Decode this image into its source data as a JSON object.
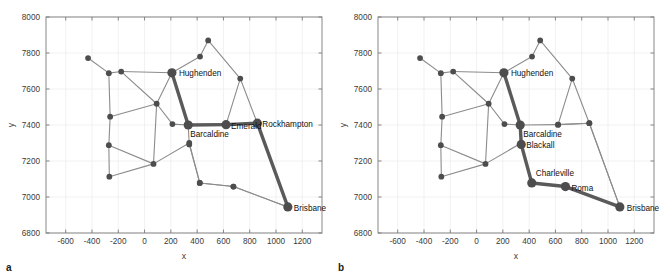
{
  "figure": {
    "type": "two-panel-network-map",
    "panels": [
      {
        "letter": "a",
        "highlighted_path": [
          "Hughenden",
          "Barcaldine",
          "Emerald",
          "Rockhampton",
          "Brisbane"
        ],
        "labeled_nodes": [
          "Hughenden",
          "Barcaldine",
          "Emerald",
          "Rockhampton",
          "Brisbane"
        ]
      },
      {
        "letter": "b",
        "highlighted_path": [
          "Hughenden",
          "Barcaldine",
          "Blackall",
          "Charleville",
          "Roma",
          "Brisbane"
        ],
        "labeled_nodes": [
          "Hughenden",
          "Barcaldine",
          "Blackall",
          "Charleville",
          "Roma",
          "Brisbane"
        ]
      }
    ]
  },
  "chart_data": {
    "type": "scatter",
    "title": "",
    "xlabel": "x",
    "ylabel": "y",
    "xlim": [
      -750,
      1350
    ],
    "ylim": [
      6800,
      8000
    ],
    "xticks": [
      -600,
      -400,
      -200,
      0,
      200,
      400,
      600,
      800,
      1000,
      1200
    ],
    "xticklabels": [
      "-600",
      "-400",
      "-200",
      "0",
      "200",
      "400",
      "600",
      "800",
      "1000",
      "1200"
    ],
    "yticks": [
      6800,
      7000,
      7200,
      7400,
      7600,
      7800,
      8000
    ],
    "yticklabels": [
      "6800",
      "7000",
      "7200",
      "7400",
      "7600",
      "7800",
      "8000"
    ],
    "grid": true,
    "legend": "none",
    "colors": {
      "node": "#4d4d4d",
      "edge": "#8c8c8c",
      "highlight_edge": "#5a5a5a",
      "grid": "#ededed",
      "axis": "#7a7a7a",
      "background": "#ffffff",
      "label_text": "#111111"
    },
    "nodes": [
      {
        "id": "n0",
        "x": -430,
        "y": 7772,
        "size": "small",
        "label": ""
      },
      {
        "id": "n1",
        "x": -272,
        "y": 7688,
        "size": "small",
        "label": ""
      },
      {
        "id": "n2",
        "x": -178,
        "y": 7697,
        "size": "small",
        "label": ""
      },
      {
        "id": "n3",
        "x": -262,
        "y": 7446,
        "size": "small",
        "label": ""
      },
      {
        "id": "n4",
        "x": -272,
        "y": 7288,
        "size": "small",
        "label": ""
      },
      {
        "id": "n5",
        "x": -268,
        "y": 7113,
        "size": "small",
        "label": ""
      },
      {
        "id": "n6",
        "x": 92,
        "y": 7518,
        "size": "small",
        "label": ""
      },
      {
        "id": "n7",
        "x": 68,
        "y": 7184,
        "size": "small",
        "label": ""
      },
      {
        "id": "n8",
        "x": 212,
        "y": 7405,
        "size": "small",
        "label": ""
      },
      {
        "id": "n9",
        "x": 340,
        "y": 7300,
        "size": "small",
        "label": ""
      },
      {
        "id": "n10",
        "x": 422,
        "y": 7780,
        "size": "small",
        "label": ""
      },
      {
        "id": "n11",
        "x": 484,
        "y": 7870,
        "size": "small",
        "label": ""
      },
      {
        "id": "n12",
        "x": 728,
        "y": 7658,
        "size": "small",
        "label": ""
      },
      {
        "id": "n13",
        "x": 620,
        "y": 7402,
        "size": "small",
        "label": ""
      },
      {
        "id": "n14",
        "x": 858,
        "y": 7410,
        "size": "small",
        "label": ""
      },
      {
        "id": "n15",
        "x": 420,
        "y": 7078,
        "size": "small",
        "label": ""
      },
      {
        "id": "n16",
        "x": 676,
        "y": 7058,
        "size": "small",
        "label": ""
      },
      {
        "id": "Hughenden",
        "x": 208,
        "y": 7690,
        "size": "large",
        "label": "Hughenden"
      },
      {
        "id": "Barcaldine",
        "x": 332,
        "y": 7400,
        "size": "large",
        "label": "Barcaldine"
      },
      {
        "id": "Blackall",
        "x": 340,
        "y": 7292,
        "size": "large",
        "label": "Blackall"
      },
      {
        "id": "Emerald",
        "x": 620,
        "y": 7402,
        "size": "large",
        "label": "Emerald"
      },
      {
        "id": "Rockhampton",
        "x": 858,
        "y": 7410,
        "size": "large",
        "label": "Rockhampton"
      },
      {
        "id": "Charleville",
        "x": 420,
        "y": 7078,
        "size": "large",
        "label": "Charleville"
      },
      {
        "id": "Roma",
        "x": 676,
        "y": 7058,
        "size": "large",
        "label": "Roma"
      },
      {
        "id": "Brisbane",
        "x": 1090,
        "y": 6945,
        "size": "large",
        "label": "Brisbane"
      }
    ],
    "edges": [
      [
        "n0",
        "n1"
      ],
      [
        "n1",
        "n2"
      ],
      [
        "n1",
        "n3"
      ],
      [
        "n2",
        "Hughenden"
      ],
      [
        "n2",
        "n6"
      ],
      [
        "n3",
        "n4"
      ],
      [
        "n3",
        "n6"
      ],
      [
        "n4",
        "n5"
      ],
      [
        "n4",
        "n7"
      ],
      [
        "n5",
        "n7"
      ],
      [
        "n6",
        "n7"
      ],
      [
        "n6",
        "n8"
      ],
      [
        "n6",
        "Hughenden"
      ],
      [
        "n7",
        "n9"
      ],
      [
        "n8",
        "Barcaldine"
      ],
      [
        "n9",
        "Blackall"
      ],
      [
        "n9",
        "n15"
      ],
      [
        "Hughenden",
        "n10"
      ],
      [
        "n10",
        "n11"
      ],
      [
        "n11",
        "n12"
      ],
      [
        "n12",
        "n13"
      ],
      [
        "n12",
        "n14"
      ],
      [
        "n13",
        "n14"
      ],
      [
        "n14",
        "Brisbane"
      ],
      [
        "n15",
        "n16"
      ],
      [
        "n16",
        "Brisbane"
      ],
      [
        "Hughenden",
        "Barcaldine"
      ],
      [
        "Barcaldine",
        "Blackall"
      ],
      [
        "Barcaldine",
        "Emerald"
      ],
      [
        "Emerald",
        "Rockhampton"
      ],
      [
        "Rockhampton",
        "Brisbane"
      ],
      [
        "Blackall",
        "Charleville"
      ],
      [
        "Charleville",
        "Roma"
      ],
      [
        "Roma",
        "Brisbane"
      ]
    ],
    "panel_a_highlight_edges": [
      [
        "Hughenden",
        "Barcaldine"
      ],
      [
        "Barcaldine",
        "Emerald"
      ],
      [
        "Emerald",
        "Rockhampton"
      ],
      [
        "Rockhampton",
        "Brisbane"
      ]
    ],
    "panel_b_highlight_edges": [
      [
        "Hughenden",
        "Barcaldine"
      ],
      [
        "Barcaldine",
        "Blackall"
      ],
      [
        "Blackall",
        "Charleville"
      ],
      [
        "Charleville",
        "Roma"
      ],
      [
        "Roma",
        "Brisbane"
      ]
    ],
    "panel_a_large_nodes": [
      "Hughenden",
      "Barcaldine",
      "Emerald",
      "Rockhampton",
      "Brisbane"
    ],
    "panel_b_large_nodes": [
      "Hughenden",
      "Barcaldine",
      "Blackall",
      "Charleville",
      "Roma",
      "Brisbane"
    ],
    "panel_a_labels": [
      {
        "id": "Hughenden",
        "text": "Hughenden",
        "anchor": "start",
        "dx": 7,
        "dy": 3
      },
      {
        "id": "Barcaldine",
        "text": "Barcaldine",
        "anchor": "start",
        "dx": 2,
        "dy": 12
      },
      {
        "id": "Emerald",
        "text": "Emerald",
        "anchor": "start",
        "dx": 5,
        "dy": 4
      },
      {
        "id": "Rockhampton",
        "text": "Rockhampton",
        "anchor": "start",
        "dx": 5,
        "dy": 4
      },
      {
        "id": "Brisbane",
        "text": "Brisbane",
        "anchor": "start",
        "dx": 6,
        "dy": 4
      }
    ],
    "panel_b_labels": [
      {
        "id": "Hughenden",
        "text": "Hughenden",
        "anchor": "start",
        "dx": 7,
        "dy": 3
      },
      {
        "id": "Barcaldine",
        "text": "Barcaldine",
        "anchor": "start",
        "dx": 3,
        "dy": 12
      },
      {
        "id": "Blackall",
        "text": "Blackall",
        "anchor": "start",
        "dx": 5,
        "dy": 4
      },
      {
        "id": "Charleville",
        "text": "Charleville",
        "anchor": "start",
        "dx": 4,
        "dy": -7
      },
      {
        "id": "Roma",
        "text": "Roma",
        "anchor": "start",
        "dx": 6,
        "dy": 4
      },
      {
        "id": "Brisbane",
        "text": "Brisbane",
        "anchor": "start",
        "dx": 7,
        "dy": 4
      }
    ]
  }
}
